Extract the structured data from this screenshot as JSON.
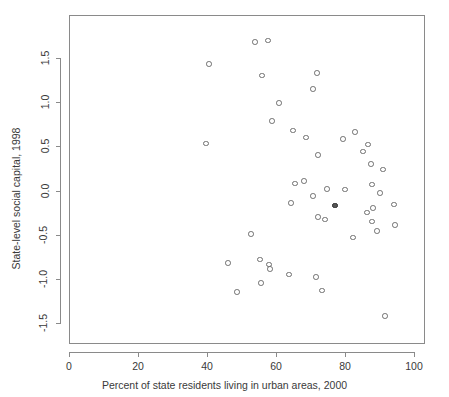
{
  "chart_data": {
    "type": "scatter",
    "title": "",
    "xlabel": "Percent of state residents living in urban areas, 2000",
    "ylabel": "State-level social capital, 1998",
    "xlim": [
      34,
      103
    ],
    "ylim": [
      -1.6,
      1.78
    ],
    "grid": false,
    "legend": null,
    "xticks": [
      0,
      20,
      40,
      60,
      80,
      100
    ],
    "xtick_labels": [
      "0",
      "20",
      "40",
      "60",
      "80",
      "100"
    ],
    "yticks": [
      1.5,
      1.0,
      0.5,
      0.0,
      -0.5,
      -1.0,
      -1.5
    ],
    "ytick_labels": [
      "1.5",
      "1.0",
      "0.5",
      "0.0",
      "-0.5",
      "-1.0",
      "-1.5"
    ],
    "marker": "open-circle",
    "marker_color": "#6f6f6f",
    "n_points": 48,
    "points": [
      {
        "x": 53.9,
        "y": 1.68
      },
      {
        "x": 57.7,
        "y": 1.7
      },
      {
        "x": 40.6,
        "y": 1.43
      },
      {
        "x": 55.9,
        "y": 1.3
      },
      {
        "x": 71.9,
        "y": 1.33
      },
      {
        "x": 70.7,
        "y": 1.15
      },
      {
        "x": 60.9,
        "y": 0.99
      },
      {
        "x": 58.8,
        "y": 0.79
      },
      {
        "x": 64.9,
        "y": 0.68
      },
      {
        "x": 68.7,
        "y": 0.6
      },
      {
        "x": 39.7,
        "y": 0.53
      },
      {
        "x": 82.9,
        "y": 0.66
      },
      {
        "x": 79.4,
        "y": 0.58
      },
      {
        "x": 72.2,
        "y": 0.4
      },
      {
        "x": 86.7,
        "y": 0.52
      },
      {
        "x": 85.2,
        "y": 0.44
      },
      {
        "x": 87.5,
        "y": 0.3
      },
      {
        "x": 91.0,
        "y": 0.24
      },
      {
        "x": 65.5,
        "y": 0.08
      },
      {
        "x": 68.1,
        "y": 0.11
      },
      {
        "x": 74.8,
        "y": 0.02
      },
      {
        "x": 80.0,
        "y": 0.01
      },
      {
        "x": 87.8,
        "y": 0.07
      },
      {
        "x": 70.7,
        "y": -0.06
      },
      {
        "x": 64.3,
        "y": -0.14
      },
      {
        "x": 90.1,
        "y": -0.03
      },
      {
        "x": 77.1,
        "y": -0.17
      },
      {
        "x": 94.2,
        "y": -0.16
      },
      {
        "x": 86.4,
        "y": -0.25
      },
      {
        "x": 88.1,
        "y": -0.2
      },
      {
        "x": 72.2,
        "y": -0.3
      },
      {
        "x": 74.2,
        "y": -0.33
      },
      {
        "x": 87.8,
        "y": -0.35
      },
      {
        "x": 94.5,
        "y": -0.39
      },
      {
        "x": 89.3,
        "y": -0.46
      },
      {
        "x": 82.3,
        "y": -0.53
      },
      {
        "x": 52.8,
        "y": -0.49
      },
      {
        "x": 46.1,
        "y": -0.82
      },
      {
        "x": 55.4,
        "y": -0.78
      },
      {
        "x": 58.0,
        "y": -0.84
      },
      {
        "x": 58.3,
        "y": -0.89
      },
      {
        "x": 63.8,
        "y": -0.95
      },
      {
        "x": 71.6,
        "y": -0.98
      },
      {
        "x": 55.7,
        "y": -1.05
      },
      {
        "x": 48.7,
        "y": -1.15
      },
      {
        "x": 73.3,
        "y": -1.13
      },
      {
        "x": 91.6,
        "y": -1.42
      },
      {
        "x": 77.1,
        "y": -0.17,
        "filled": true
      }
    ]
  },
  "axes": {
    "x_title": "Percent of state residents living in urban areas, 2000",
    "y_title": "State-level social capital, 1998"
  }
}
